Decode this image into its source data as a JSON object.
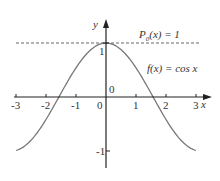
{
  "chart_data": {
    "type": "line",
    "title": "",
    "xlabel": "x",
    "ylabel": "y",
    "xlim": [
      -3,
      3
    ],
    "ylim": [
      -1.3,
      1.6
    ],
    "x_ticks": [
      "-3",
      "-2",
      "-1",
      "0",
      "1",
      "2",
      "3"
    ],
    "y_ticks": [
      "-1",
      "0",
      "1"
    ],
    "grid": false,
    "series": [
      {
        "name": "f(x) = cos x",
        "function": "cos x",
        "style": "solid",
        "color": "#777777",
        "x": [
          -3,
          -2.5,
          -2,
          -1.5708,
          -1,
          -0.5,
          0,
          0.5,
          1,
          1.5708,
          2,
          2.5,
          3
        ],
        "values": [
          -0.99,
          -0.801,
          -0.416,
          0,
          0.54,
          0.878,
          1,
          0.878,
          0.54,
          0,
          -0.416,
          -0.801,
          -0.99
        ]
      },
      {
        "name": "P0(x) = 1",
        "function": "1",
        "style": "dashed",
        "color": "#777777",
        "x": [
          -3.3,
          3.3
        ],
        "values": [
          1,
          1
        ]
      }
    ],
    "annotations": [
      "P0(x) = 1",
      "f(x) = cos x"
    ]
  },
  "labels": {
    "y_axis": "y",
    "x_axis": "x",
    "p0_label_P": "P",
    "p0_label_sub": "0",
    "p0_label_rest": "(x) = 1",
    "f_label": "f(x) = cos x",
    "origin_upper": "0",
    "x_ticks": [
      "-3",
      "-2",
      "-1",
      "0",
      "1",
      "2",
      "3"
    ],
    "y_tick_1": "1",
    "y_tick_m1": "-1"
  },
  "colors": {
    "curve": "#777777",
    "axis": "#222222",
    "text": "#333333"
  }
}
